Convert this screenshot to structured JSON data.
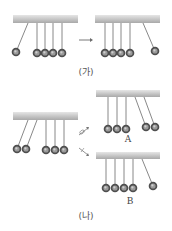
{
  "colors": {
    "bar_top": "#e6e6e6",
    "bar_bottom": "#a9a9a9",
    "ball": "#4e4e4e",
    "string": "#6a6a6a",
    "text": "#555555"
  },
  "labels": {
    "panel_ga": "(가)",
    "panel_na": "(나)",
    "option_a": "A",
    "option_b": "B"
  },
  "icons": {
    "transition_arrow": "right-arrow-icon",
    "question_arrow_up": "crossed-arrow-icon",
    "question_arrow_down": "crossed-arrow-icon"
  },
  "panels": [
    {
      "id": "ga-before",
      "bar": {
        "x": 13,
        "y": 15,
        "w": 65,
        "h": 8
      },
      "pendulums": [
        {
          "ax": 28,
          "bx": 16,
          "by": 52
        },
        {
          "ax": 37,
          "bx": 37,
          "by": 53
        },
        {
          "ax": 45,
          "bx": 45,
          "by": 53
        },
        {
          "ax": 53,
          "bx": 53,
          "by": 53
        },
        {
          "ax": 62,
          "bx": 62,
          "by": 53
        }
      ]
    },
    {
      "id": "ga-after",
      "bar": {
        "x": 95,
        "y": 15,
        "w": 65,
        "h": 8
      },
      "pendulums": [
        {
          "ax": 105,
          "bx": 105,
          "by": 53
        },
        {
          "ax": 113,
          "bx": 113,
          "by": 53
        },
        {
          "ax": 121,
          "bx": 121,
          "by": 53
        },
        {
          "ax": 130,
          "bx": 130,
          "by": 53
        },
        {
          "ax": 143,
          "bx": 155,
          "by": 51
        }
      ]
    },
    {
      "id": "na-before",
      "bar": {
        "x": 13,
        "y": 112,
        "w": 65,
        "h": 8
      },
      "pendulums": [
        {
          "ax": 28,
          "bx": 17,
          "by": 149
        },
        {
          "ax": 37,
          "bx": 26,
          "by": 149
        },
        {
          "ax": 46,
          "bx": 46,
          "by": 150
        },
        {
          "ax": 55,
          "bx": 55,
          "by": 150
        },
        {
          "ax": 64,
          "bx": 64,
          "by": 150
        }
      ]
    },
    {
      "id": "na-option-a",
      "bar": {
        "x": 96,
        "y": 90,
        "w": 64,
        "h": 7
      },
      "pendulums": [
        {
          "ax": 108,
          "bx": 108,
          "by": 129
        },
        {
          "ax": 117,
          "bx": 117,
          "by": 129
        },
        {
          "ax": 126,
          "bx": 126,
          "by": 129
        },
        {
          "ax": 135,
          "bx": 146,
          "by": 127
        },
        {
          "ax": 144,
          "bx": 155,
          "by": 127
        }
      ]
    },
    {
      "id": "na-option-b",
      "bar": {
        "x": 96,
        "y": 152,
        "w": 64,
        "h": 7
      },
      "pendulums": [
        {
          "ax": 106,
          "bx": 106,
          "by": 188
        },
        {
          "ax": 115,
          "bx": 115,
          "by": 188
        },
        {
          "ax": 124,
          "bx": 124,
          "by": 188
        },
        {
          "ax": 133,
          "bx": 133,
          "by": 188
        },
        {
          "ax": 142,
          "bx": 153,
          "by": 186
        }
      ]
    }
  ],
  "text_positions": {
    "panel_ga": {
      "x": 86,
      "y": 75
    },
    "panel_na": {
      "x": 86,
      "y": 219
    },
    "option_a": {
      "x": 128,
      "y": 142
    },
    "option_b": {
      "x": 130,
      "y": 204
    }
  }
}
